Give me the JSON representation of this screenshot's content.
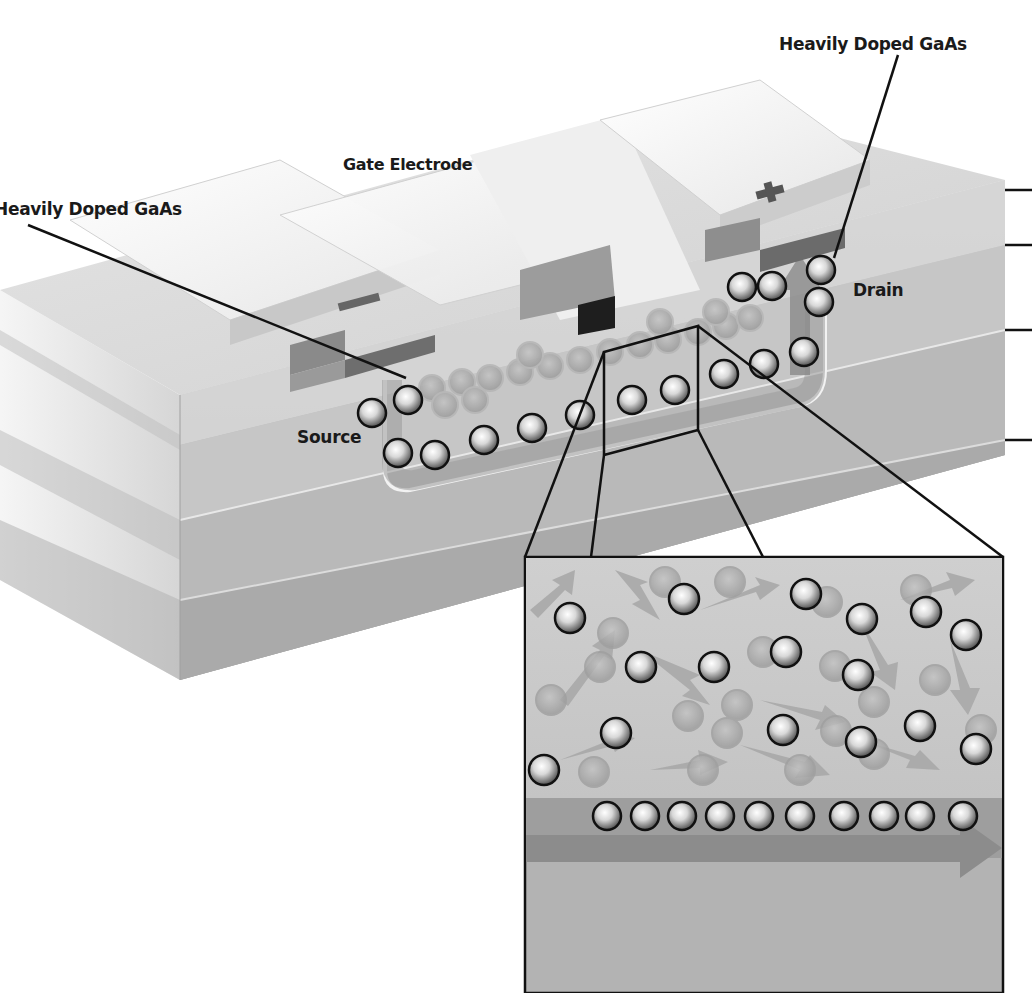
{
  "diagram": {
    "labels": {
      "heavily_doped_right": "Heavily Doped GaAs",
      "heavily_doped_left": "Heavily Doped GaAs",
      "gate": "Gate Electrode",
      "drain": "Drain",
      "source": "Source"
    },
    "polarity": {
      "source_electrode_sign": "−",
      "drain_electrode_sign": "+"
    },
    "right_edge_layer_ticks": 4,
    "inset": {
      "description": "Magnified view of channel: scattered electrons above, ordered electron row moving along arrow below",
      "ordered_row_electron_count": 10,
      "flow_direction": "left-to-right"
    },
    "colors": {
      "background": "#ffffff",
      "layer_light": "#d9d9d9",
      "layer_mid": "#bdbdbd",
      "layer_dark": "#a6a6a6",
      "electrode": "#f4f4f4",
      "contact_dark": "#6e6e6e",
      "leader_line": "#111111"
    }
  }
}
